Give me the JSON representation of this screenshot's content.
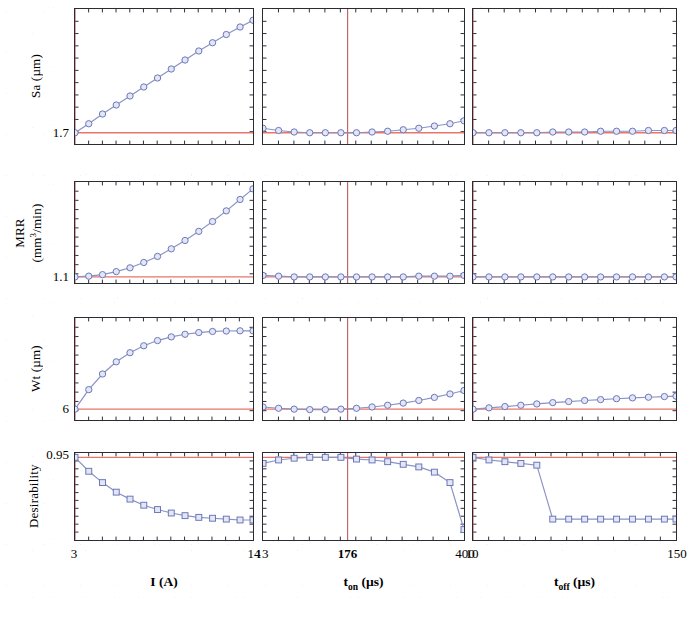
{
  "figure": {
    "type": "desirability-optimization-plot-matrix",
    "width": 670,
    "height": 619,
    "line_color": "#8a93c4",
    "marker_edge_color": "#6b76b8",
    "marker_face_color": "#e3e6f4",
    "target_line_color": "#e8746a",
    "current_line_color": "#b5484a",
    "axis_color": "#2b2b33"
  },
  "rows": [
    {
      "id": "sa",
      "label": "Sa (µm)",
      "label_html": "Sa (µm)",
      "target_value": "1.7",
      "ylim": [
        1.55,
        3.35
      ],
      "target": 1.7
    },
    {
      "id": "mrr",
      "label": "MRR (mm3/min)",
      "label_line1": "MRR",
      "label_line2": "(mm³/min)",
      "target_value": "1.1",
      "ylim": [
        1.02,
        2.35
      ],
      "target": 1.1
    },
    {
      "id": "wt",
      "label": "Wt (µm)",
      "label_html": "Wt (µm)",
      "target_value": "6",
      "ylim": [
        5.5,
        10.2
      ],
      "target": 6
    },
    {
      "id": "desirability",
      "label": "Desirability",
      "label_html": "Desirability",
      "target_value": "0.95",
      "ylim": [
        0.0,
        1.0
      ],
      "target": 0.95
    }
  ],
  "columns": [
    {
      "id": "current",
      "title": "I (A)",
      "title_main": "I",
      "title_sub": "",
      "title_unit": "(A)",
      "xlim": [
        3,
        14
      ],
      "ticks": [
        "3",
        "14"
      ],
      "tick_values": [
        3,
        14
      ],
      "current_setting": 3,
      "current_label": "",
      "current_label_bold": false
    },
    {
      "id": "t_on",
      "title": "t_on (µs)",
      "title_main": "t",
      "title_sub": "on",
      "title_unit": "(µs)",
      "xlim": [
        13,
        400
      ],
      "ticks": [
        "13",
        "176",
        "400"
      ],
      "tick_values": [
        13,
        176,
        400
      ],
      "current_setting": 176,
      "current_label": "176",
      "current_label_bold": true
    },
    {
      "id": "t_off",
      "title": "t_off (µs)",
      "title_main": "t",
      "title_sub": "off",
      "title_unit": "(µs)",
      "xlim": [
        10,
        150
      ],
      "ticks": [
        "10",
        "150"
      ],
      "tick_values": [
        10,
        150
      ],
      "current_setting": 10,
      "current_label": "",
      "current_label_bold": false
    }
  ],
  "chart_data": {
    "type": "line",
    "title": "",
    "marker": {
      "rows_0_1_2": "open-circle",
      "row_3": "open-square"
    },
    "panels": [
      {
        "row": "sa",
        "column": "current",
        "xlabel": "I (A)",
        "ylabel": "Sa (µm)",
        "xlim": [
          3,
          14
        ],
        "ylim": [
          1.55,
          3.35
        ],
        "x": [
          3.0,
          3.85,
          4.7,
          5.55,
          6.4,
          7.25,
          8.1,
          8.95,
          9.8,
          10.65,
          11.5,
          12.35,
          13.2,
          14.0
        ],
        "y": [
          1.7,
          1.82,
          1.95,
          2.07,
          2.19,
          2.31,
          2.43,
          2.55,
          2.67,
          2.79,
          2.9,
          3.01,
          3.11,
          3.2
        ],
        "target_hline": 1.7,
        "current_vline": 3
      },
      {
        "row": "sa",
        "column": "t_on",
        "xlabel": "t_on (µs)",
        "ylabel": "Sa (µm)",
        "xlim": [
          13,
          400
        ],
        "ylim": [
          1.55,
          3.35
        ],
        "x": [
          13,
          43,
          73,
          103,
          133,
          163,
          193,
          223,
          253,
          283,
          313,
          343,
          373,
          400
        ],
        "y": [
          1.76,
          1.73,
          1.71,
          1.7,
          1.7,
          1.7,
          1.7,
          1.71,
          1.72,
          1.74,
          1.76,
          1.79,
          1.82,
          1.86
        ],
        "target_hline": 1.7,
        "current_vline": 176
      },
      {
        "row": "sa",
        "column": "t_off",
        "xlabel": "t_off (µs)",
        "ylabel": "Sa (µm)",
        "xlim": [
          10,
          150
        ],
        "ylim": [
          1.55,
          3.35
        ],
        "x": [
          10,
          21,
          32,
          43,
          54,
          65,
          76,
          87,
          98,
          109,
          120,
          131,
          142,
          150
        ],
        "y": [
          1.7,
          1.7,
          1.7,
          1.7,
          1.7,
          1.71,
          1.71,
          1.71,
          1.72,
          1.72,
          1.72,
          1.73,
          1.73,
          1.73
        ],
        "target_hline": 1.7,
        "current_vline": 10
      },
      {
        "row": "mrr",
        "column": "current",
        "xlabel": "I (A)",
        "ylabel": "MRR (mm³/min)",
        "xlim": [
          3,
          14
        ],
        "ylim": [
          1.02,
          2.35
        ],
        "x": [
          3.0,
          3.85,
          4.7,
          5.55,
          6.4,
          7.25,
          8.1,
          8.95,
          9.8,
          10.65,
          11.5,
          12.35,
          13.2,
          14.0
        ],
        "y": [
          1.1,
          1.11,
          1.13,
          1.17,
          1.22,
          1.29,
          1.37,
          1.47,
          1.58,
          1.7,
          1.83,
          1.97,
          2.12,
          2.26
        ],
        "target_hline": 1.1,
        "current_vline": 3
      },
      {
        "row": "mrr",
        "column": "t_on",
        "xlabel": "t_on (µs)",
        "ylabel": "MRR (mm³/min)",
        "xlim": [
          13,
          400
        ],
        "ylim": [
          1.02,
          2.35
        ],
        "x": [
          13,
          43,
          73,
          103,
          133,
          163,
          193,
          223,
          253,
          283,
          313,
          343,
          373,
          400
        ],
        "y": [
          1.12,
          1.11,
          1.1,
          1.1,
          1.1,
          1.1,
          1.1,
          1.1,
          1.1,
          1.1,
          1.11,
          1.11,
          1.11,
          1.12
        ],
        "target_hline": 1.1,
        "current_vline": 176
      },
      {
        "row": "mrr",
        "column": "t_off",
        "xlabel": "t_off (µs)",
        "ylabel": "MRR (mm³/min)",
        "xlim": [
          10,
          150
        ],
        "ylim": [
          1.02,
          2.35
        ],
        "x": [
          10,
          21,
          32,
          43,
          54,
          65,
          76,
          87,
          98,
          109,
          120,
          131,
          142,
          150
        ],
        "y": [
          1.1,
          1.1,
          1.1,
          1.1,
          1.1,
          1.1,
          1.1,
          1.1,
          1.1,
          1.1,
          1.1,
          1.1,
          1.1,
          1.1
        ],
        "target_hline": 1.1,
        "current_vline": 10
      },
      {
        "row": "wt",
        "column": "current",
        "xlabel": "I (A)",
        "ylabel": "Wt (µm)",
        "xlim": [
          3,
          14
        ],
        "ylim": [
          5.5,
          10.2
        ],
        "x": [
          3.0,
          3.85,
          4.7,
          5.55,
          6.4,
          7.25,
          8.1,
          8.95,
          9.8,
          10.65,
          11.5,
          12.35,
          13.2,
          14.0
        ],
        "y": [
          6.0,
          6.9,
          7.62,
          8.18,
          8.6,
          8.92,
          9.16,
          9.33,
          9.45,
          9.53,
          9.58,
          9.6,
          9.61,
          9.61
        ],
        "target_hline": 6,
        "current_vline": 3
      },
      {
        "row": "wt",
        "column": "t_on",
        "xlabel": "t_on (µs)",
        "ylabel": "Wt (µm)",
        "xlim": [
          13,
          400
        ],
        "ylim": [
          5.5,
          10.2
        ],
        "x": [
          13,
          43,
          73,
          103,
          133,
          163,
          193,
          223,
          253,
          283,
          313,
          343,
          373,
          400
        ],
        "y": [
          6.1,
          6.04,
          6.0,
          5.98,
          5.98,
          6.0,
          6.04,
          6.1,
          6.18,
          6.28,
          6.4,
          6.54,
          6.7,
          6.86
        ],
        "target_hline": 6,
        "current_vline": 176
      },
      {
        "row": "wt",
        "column": "t_off",
        "xlabel": "t_off (µs)",
        "ylabel": "Wt (µm)",
        "xlim": [
          10,
          150
        ],
        "ylim": [
          5.5,
          10.2
        ],
        "x": [
          10,
          21,
          32,
          43,
          54,
          65,
          76,
          87,
          98,
          109,
          120,
          131,
          142,
          150
        ],
        "y": [
          6.0,
          6.06,
          6.12,
          6.18,
          6.24,
          6.3,
          6.35,
          6.4,
          6.44,
          6.48,
          6.52,
          6.55,
          6.58,
          6.6
        ],
        "target_hline": 6,
        "current_vline": 10
      },
      {
        "row": "desirability",
        "column": "current",
        "xlabel": "I (A)",
        "ylabel": "Desirability",
        "xlim": [
          3,
          14
        ],
        "ylim": [
          0.0,
          1.0
        ],
        "x": [
          3.0,
          3.85,
          4.7,
          5.55,
          6.4,
          7.25,
          8.1,
          8.95,
          9.8,
          10.65,
          11.5,
          12.35,
          13.2,
          14.0
        ],
        "y": [
          0.95,
          0.79,
          0.66,
          0.55,
          0.47,
          0.4,
          0.35,
          0.31,
          0.28,
          0.26,
          0.25,
          0.24,
          0.23,
          0.23
        ],
        "target_hline": 0.95,
        "current_vline": 3
      },
      {
        "row": "desirability",
        "column": "t_on",
        "xlabel": "t_on (µs)",
        "ylabel": "Desirability",
        "xlim": [
          13,
          400
        ],
        "ylim": [
          0.0,
          1.0
        ],
        "x": [
          13,
          43,
          73,
          103,
          133,
          163,
          193,
          223,
          253,
          283,
          313,
          343,
          373,
          400
        ],
        "y": [
          0.88,
          0.92,
          0.94,
          0.95,
          0.95,
          0.95,
          0.93,
          0.92,
          0.9,
          0.87,
          0.84,
          0.78,
          0.66,
          0.12
        ],
        "target_hline": 0.95,
        "current_vline": 176
      },
      {
        "row": "desirability",
        "column": "t_off",
        "xlabel": "t_off (µs)",
        "ylabel": "Desirability",
        "xlim": [
          10,
          150
        ],
        "ylim": [
          0.0,
          1.0
        ],
        "x": [
          10,
          21,
          32,
          43,
          54,
          65,
          76,
          87,
          98,
          109,
          120,
          131,
          142,
          150
        ],
        "y": [
          0.95,
          0.92,
          0.9,
          0.88,
          0.86,
          0.24,
          0.24,
          0.24,
          0.24,
          0.24,
          0.24,
          0.24,
          0.24,
          0.24
        ],
        "target_hline": 0.95,
        "current_vline": 10
      }
    ]
  }
}
